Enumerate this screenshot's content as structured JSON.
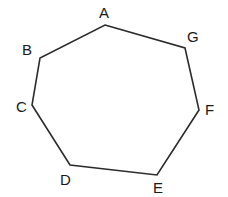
{
  "figure": {
    "kind": "polygon-diagram",
    "name": "labelled-heptagon",
    "background_color": "#ffffff",
    "stroke_color": "#2b2b2b",
    "stroke_width": 1.6,
    "fill": "none",
    "label_color": "#1a1a1a",
    "label_font_size": 15,
    "canvas": {
      "width": 228,
      "height": 197
    },
    "vertices": [
      {
        "id": "A",
        "label": "A",
        "x": 105,
        "y": 25,
        "label_x": 99,
        "label_y": 5
      },
      {
        "id": "G",
        "label": "G",
        "x": 185,
        "y": 48,
        "label_x": 187,
        "label_y": 29
      },
      {
        "id": "F",
        "label": "F",
        "x": 199,
        "y": 110,
        "label_x": 205,
        "label_y": 102
      },
      {
        "id": "E",
        "label": "E",
        "x": 157,
        "y": 175,
        "label_x": 153,
        "label_y": 180
      },
      {
        "id": "D",
        "label": "D",
        "x": 70,
        "y": 165,
        "label_x": 60,
        "label_y": 172
      },
      {
        "id": "C",
        "label": "C",
        "x": 32,
        "y": 105,
        "label_x": 16,
        "label_y": 99
      },
      {
        "id": "B",
        "label": "B",
        "x": 40,
        "y": 58,
        "label_x": 22,
        "label_y": 42
      }
    ],
    "edges": [
      {
        "from": "A",
        "to": "G"
      },
      {
        "from": "G",
        "to": "F"
      },
      {
        "from": "F",
        "to": "E"
      },
      {
        "from": "E",
        "to": "D"
      },
      {
        "from": "D",
        "to": "C"
      },
      {
        "from": "C",
        "to": "B"
      },
      {
        "from": "B",
        "to": "A"
      }
    ],
    "polygon_points": "105,25 185,48 199,110 157,175 70,165 32,105 40,58"
  }
}
